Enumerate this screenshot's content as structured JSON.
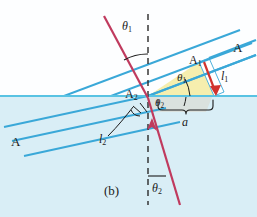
{
  "figure": {
    "caption": "(b)",
    "type": "refraction-wavefront-diagram",
    "colors": {
      "water_fill": "#d9eef6",
      "air_fill": "#fdfeff",
      "wavefront_blue": "#3aa8d8",
      "surface_line": "#59c3e3",
      "ray_crimson": "#c03a5e",
      "arrow_red": "#d1332e",
      "triangle_yellow": "#f6eeae",
      "triangle_gray": "#d7dcd8",
      "text": "#1b1b1b"
    }
  },
  "labels": {
    "theta1_top": {
      "text": "θ1",
      "base": "θ",
      "sub": "1"
    },
    "theta1_wedge": {
      "text": "θ1",
      "base": "θ",
      "sub": "1"
    },
    "theta2_wedge": {
      "text": "θ2",
      "base": "θ",
      "sub": "2"
    },
    "theta2_bottom": {
      "text": "θ2",
      "base": "θ",
      "sub": "2"
    },
    "A_upper_right": {
      "text": "A"
    },
    "A_lower_left": {
      "text": "A"
    },
    "A1": {
      "base": "A",
      "sub": "1"
    },
    "A2": {
      "base": "A",
      "sub": "2"
    },
    "l1": {
      "base": "l",
      "sub": "1"
    },
    "l2": {
      "base": "l",
      "sub": "2"
    },
    "a": {
      "text": "a"
    },
    "caption": {
      "text": "(b)"
    }
  },
  "geometry": {
    "surface_y": 96,
    "normal_x": 148,
    "incidence_angle_deg": 20,
    "refraction_angle_deg": 14,
    "note": "Wavefronts A travel in air, strike water surface at A1, refract; a is the surface distance between A1 and A2; l1 is distance travelled in air, l2 in water."
  }
}
